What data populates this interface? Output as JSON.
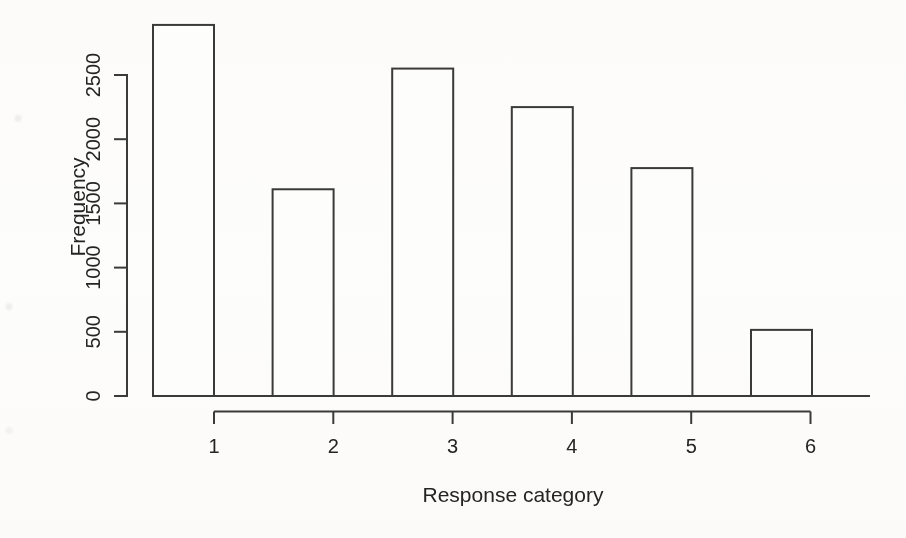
{
  "figure": {
    "background": "#fcfbfa",
    "line_color": "#3a3a3a",
    "text_color": "#242424"
  },
  "chart_data": {
    "type": "bar",
    "categories": [
      "1",
      "2",
      "3",
      "4",
      "5",
      "6"
    ],
    "values": [
      2890,
      1610,
      2550,
      2250,
      1775,
      515
    ],
    "title": "",
    "xlabel": "Response category",
    "ylabel": "Frequency",
    "yticks": [
      0,
      500,
      1000,
      1500,
      2000,
      2500
    ],
    "ylim": [
      0,
      2950
    ],
    "bar_fill": "#fdfdfc",
    "bar_outline": "#3a3a3a",
    "grid": false,
    "legend": null,
    "style": "R base graphics barplot, unfilled bars, detached category axis"
  }
}
